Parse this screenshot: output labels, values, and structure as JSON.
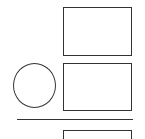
{
  "diagram": {
    "stroke_color": "#333333",
    "background": "#ffffff",
    "shapes": [
      {
        "id": "rect-top",
        "type": "rectangle",
        "label": ""
      },
      {
        "id": "circle",
        "type": "circle",
        "label": ""
      },
      {
        "id": "rect-middle",
        "type": "rectangle",
        "label": ""
      },
      {
        "id": "divider",
        "type": "horizontal-line",
        "label": ""
      },
      {
        "id": "rect-bottom",
        "type": "rectangle-partial",
        "label": ""
      }
    ]
  }
}
